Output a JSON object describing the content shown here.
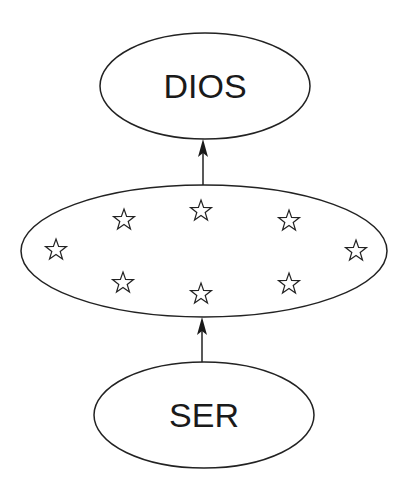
{
  "diagram": {
    "type": "hierarchy",
    "stroke_color": "#222222",
    "background": "#ffffff",
    "nodes": [
      {
        "id": "top",
        "label": "DIOS",
        "shape": "ellipse",
        "cx": 205,
        "cy": 86,
        "rx": 105,
        "ry": 53
      },
      {
        "id": "middle",
        "label": "",
        "shape": "ellipse",
        "cx": 204,
        "cy": 251,
        "rx": 183,
        "ry": 66,
        "contents": "8 star icons"
      },
      {
        "id": "bottom",
        "label": "SER",
        "shape": "ellipse",
        "cx": 204,
        "cy": 415,
        "rx": 110,
        "ry": 53
      }
    ],
    "stars": [
      {
        "cx": 56,
        "cy": 250
      },
      {
        "cx": 124,
        "cy": 220
      },
      {
        "cx": 201,
        "cy": 211
      },
      {
        "cx": 289,
        "cy": 221
      },
      {
        "cx": 356,
        "cy": 251
      },
      {
        "cx": 123,
        "cy": 283
      },
      {
        "cx": 201,
        "cy": 294
      },
      {
        "cx": 289,
        "cy": 284
      }
    ],
    "edges": [
      {
        "from": "middle",
        "to": "top",
        "direction": "up"
      },
      {
        "from": "bottom",
        "to": "middle",
        "direction": "up"
      }
    ]
  }
}
